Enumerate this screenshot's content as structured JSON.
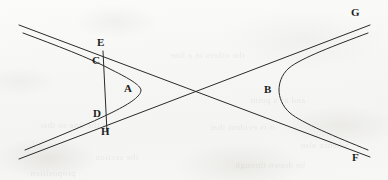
{
  "figure": {
    "background_color": "#f8f8f7",
    "stroke_color": "#2a2a2a",
    "label_color": "#1d1d1d",
    "width": 388,
    "height": 180
  },
  "labels": {
    "A": "A",
    "B": "B",
    "C": "C",
    "D": "D",
    "E": "E",
    "F": "F",
    "G": "G",
    "H": "H"
  },
  "points": [
    {
      "id": "A",
      "text": "A",
      "x": 127,
      "y": 88,
      "role": "left-branch-vertex-label"
    },
    {
      "id": "B",
      "text": "B",
      "x": 266,
      "y": 90,
      "role": "right-branch-vertex-label"
    },
    {
      "id": "C",
      "text": "C",
      "x": 93,
      "y": 61,
      "role": "transversal-meets-upper-branch"
    },
    {
      "id": "D",
      "text": "D",
      "x": 94,
      "y": 114,
      "role": "transversal-meets-lower-branch"
    },
    {
      "id": "E",
      "text": "E",
      "x": 97,
      "y": 43,
      "role": "transversal-meets-upper-asymptote"
    },
    {
      "id": "F",
      "text": "F",
      "x": 355,
      "y": 158,
      "role": "lower-asymptote-end"
    },
    {
      "id": "G",
      "text": "G",
      "x": 353,
      "y": 12,
      "role": "upper-asymptote-end"
    },
    {
      "id": "H",
      "text": "H",
      "x": 101,
      "y": 131,
      "role": "transversal-meets-lower-asymptote"
    }
  ],
  "geometry": {
    "center": {
      "x": 193,
      "y": 92
    },
    "asymptotes": [
      {
        "name": "asymptote-EG",
        "from": {
          "x": 18,
          "y": 24
        },
        "to": {
          "x": 372,
          "y": 24
        },
        "label": "G"
      },
      {
        "name": "asymptote-HF",
        "from": {
          "x": 18,
          "y": 160
        },
        "to": {
          "x": 372,
          "y": 160
        },
        "label": "F"
      }
    ],
    "branches": [
      {
        "name": "left-branch",
        "vertex": {
          "x": 141,
          "y": 90
        },
        "label": "A",
        "opens": "left"
      },
      {
        "name": "right-branch",
        "vertex": {
          "x": 279,
          "y": 90
        },
        "label": "B",
        "opens": "right"
      }
    ],
    "transversal": {
      "name": "transversal-EH",
      "from": {
        "x": 103,
        "y": 51
      },
      "to": {
        "x": 106,
        "y": 131
      }
    }
  },
  "showthrough_text": [
    {
      "text": "the others in a line",
      "x": 170,
      "y": 50
    },
    {
      "text": "and of a point",
      "x": 250,
      "y": 95
    },
    {
      "text": "of the line so that",
      "x": 40,
      "y": 120
    },
    {
      "text": "it is evident that",
      "x": 210,
      "y": 122
    },
    {
      "text": "whence also",
      "x": 300,
      "y": 140
    },
    {
      "text": "the section",
      "x": 95,
      "y": 152
    },
    {
      "text": "be drawn through",
      "x": 235,
      "y": 160
    },
    {
      "text": "proposition",
      "x": 30,
      "y": 168
    }
  ]
}
